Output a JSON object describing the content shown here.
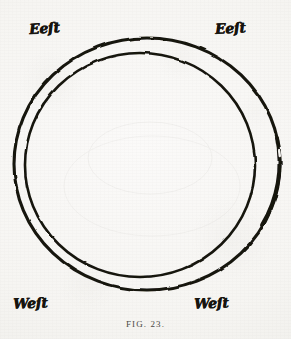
{
  "figure": {
    "caption": "FIG. 23.",
    "cut_off_text_above": "only by this light is here to find out what is first",
    "background_color": "#f8f7f5",
    "ink_color": "#16140f"
  },
  "compass_labels": [
    {
      "id": "top-left",
      "text": "Eeſt",
      "position": "top-left"
    },
    {
      "id": "top-right",
      "text": "Eeſt",
      "position": "top-right"
    },
    {
      "id": "bottom-left",
      "text": "Weſt",
      "position": "bottom-left"
    },
    {
      "id": "bottom-right",
      "text": "Weſt",
      "position": "bottom-right"
    }
  ],
  "diagram": {
    "type": "concentric-circles",
    "circles": [
      {
        "name": "outer-circle",
        "center_x": 147,
        "center_y": 164,
        "radius_x": 133,
        "radius_y": 126,
        "stroke_width": 3.1
      },
      {
        "name": "inner-circle",
        "center_x": 140,
        "center_y": 165,
        "radius_x": 115,
        "radius_y": 112,
        "stroke_width": 2.6
      }
    ]
  }
}
